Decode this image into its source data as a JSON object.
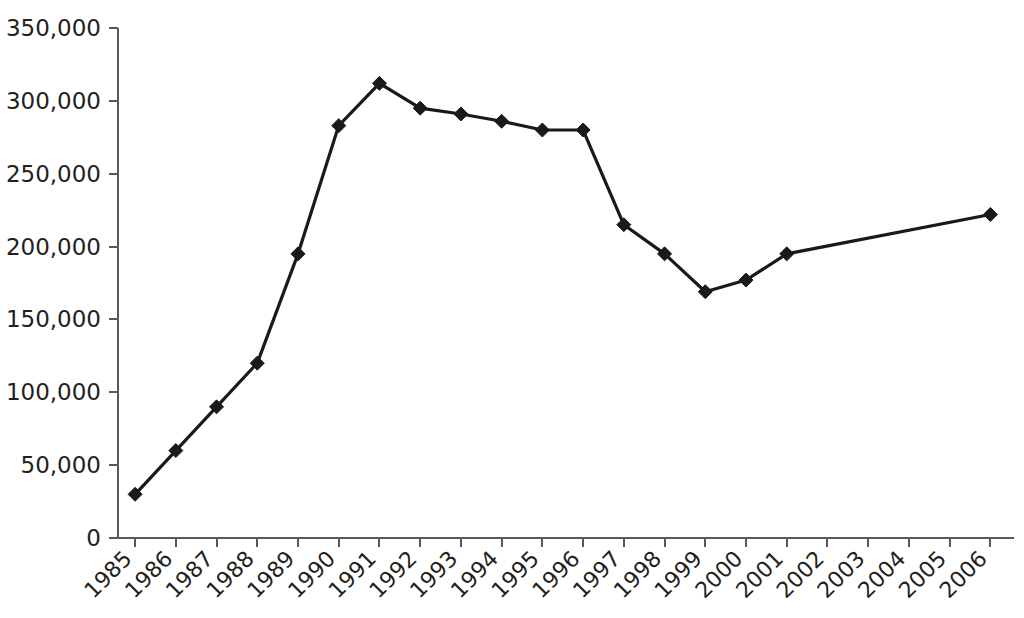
{
  "chart_data": {
    "type": "line",
    "title": "",
    "subtitle": "",
    "xlabel": "",
    "ylabel": "",
    "categories": [
      "1985",
      "1986",
      "1987",
      "1988",
      "1989",
      "1990",
      "1991",
      "1992",
      "1993",
      "1994",
      "1995",
      "1996",
      "1997",
      "1998",
      "1999",
      "2000",
      "2001",
      "2002",
      "2003",
      "2004",
      "2005",
      "2006"
    ],
    "values": [
      30000,
      60000,
      90000,
      120000,
      195000,
      283000,
      312000,
      295000,
      291000,
      286000,
      280000,
      280000,
      215000,
      195000,
      169000,
      177000,
      195000,
      null,
      null,
      null,
      null,
      222000
    ],
    "series": [
      {
        "name": "",
        "marker": "diamond",
        "color": "#1a1a1a",
        "points": [
          {
            "x": "1985",
            "y": 30000,
            "marker": true
          },
          {
            "x": "1986",
            "y": 60000,
            "marker": true
          },
          {
            "x": "1987",
            "y": 90000,
            "marker": true
          },
          {
            "x": "1988",
            "y": 120000,
            "marker": true
          },
          {
            "x": "1989",
            "y": 195000,
            "marker": true
          },
          {
            "x": "1990",
            "y": 283000,
            "marker": true
          },
          {
            "x": "1991",
            "y": 312000,
            "marker": true
          },
          {
            "x": "1992",
            "y": 295000,
            "marker": true
          },
          {
            "x": "1993",
            "y": 291000,
            "marker": true
          },
          {
            "x": "1994",
            "y": 286000,
            "marker": true
          },
          {
            "x": "1995",
            "y": 280000,
            "marker": true
          },
          {
            "x": "1996",
            "y": 280000,
            "marker": true
          },
          {
            "x": "1997",
            "y": 215000,
            "marker": true
          },
          {
            "x": "1998",
            "y": 195000,
            "marker": true
          },
          {
            "x": "1999",
            "y": 169000,
            "marker": true
          },
          {
            "x": "2000",
            "y": 177000,
            "marker": true
          },
          {
            "x": "2001",
            "y": 195000,
            "marker": true
          },
          {
            "x": "2006",
            "y": 222000,
            "marker": true
          }
        ]
      }
    ],
    "ylim": [
      0,
      350000
    ],
    "yticks": [
      0,
      50000,
      100000,
      150000,
      200000,
      250000,
      300000,
      350000
    ],
    "ytick_labels": [
      "0",
      "50,000",
      "100,000",
      "150,000",
      "200,000",
      "250,000",
      "300,000",
      "350,000"
    ],
    "xtick_labels": [
      "1985",
      "1986",
      "1987",
      "1988",
      "1989",
      "1990",
      "1991",
      "1992",
      "1993",
      "1994",
      "1995",
      "1996",
      "1997",
      "1998",
      "1999",
      "2000",
      "2001",
      "2002",
      "2003",
      "2004",
      "2005",
      "2006"
    ],
    "xtick_rotation": -45,
    "grid": false,
    "legend": null,
    "annotations": [],
    "axis_color": "#58595b",
    "text_color": "#231f20",
    "background": "#ffffff"
  },
  "layout": {
    "plot_left": 118,
    "plot_right": 1014,
    "plot_top": 28,
    "plot_bottom": 538,
    "marker_size": 7
  }
}
